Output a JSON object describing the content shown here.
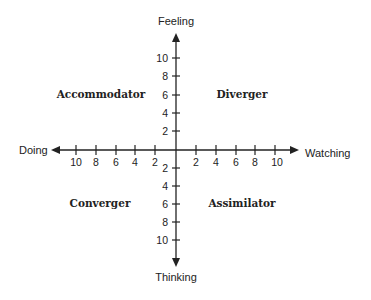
{
  "diagram": {
    "type": "quadrant",
    "axes": {
      "top": "Feeling",
      "bottom": "Thinking",
      "left": "Doing",
      "right": "Watching"
    },
    "ticks": {
      "up": [
        "10",
        "8",
        "6",
        "4",
        "2"
      ],
      "down": [
        "2",
        "4",
        "6",
        "8",
        "10"
      ],
      "left": [
        "10",
        "8",
        "6",
        "4",
        "2"
      ],
      "right": [
        "2",
        "4",
        "6",
        "8",
        "10"
      ]
    },
    "quadrants": {
      "top_left": "Accommodator",
      "top_right": "Diverger",
      "bottom_left": "Converger",
      "bottom_right": "Assimilator"
    },
    "colors": {
      "ink": "#222222",
      "background": "#ffffff"
    }
  }
}
